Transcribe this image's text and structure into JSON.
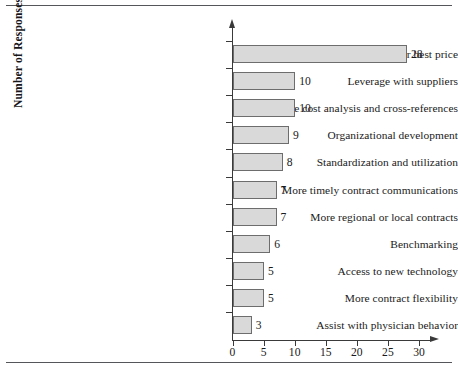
{
  "chart_data": {
    "type": "bar",
    "orientation": "horizontal",
    "title": "",
    "xlabel": "",
    "ylabel": "Number of Responses",
    "xlim": [
      0,
      32
    ],
    "xticks": [
      0,
      5,
      10,
      15,
      20,
      25,
      30
    ],
    "grid": false,
    "legend": null,
    "categories": [
      "Best product for best price",
      "Leverage with suppliers",
      "More cost analysis and cross-references",
      "Organizational development",
      "Standardization and utilization",
      "More timely contract communications",
      "More regional or local contracts",
      "Benchmarking",
      "Access to new technology",
      "More contract flexibility",
      "Assist with physician behavior"
    ],
    "values": [
      28,
      10,
      10,
      9,
      8,
      7,
      7,
      6,
      5,
      5,
      3
    ],
    "value_labels": [
      "28",
      "10",
      "10",
      "9",
      "8",
      "7",
      "7",
      "6",
      "5",
      "5",
      "3"
    ],
    "colors": {
      "bar_fill": "#d9d9d9",
      "bar_stroke": "#6d6d6d",
      "axis": "#3a3a3a",
      "text": "#1a1a1a",
      "rule": "#55565a"
    }
  }
}
